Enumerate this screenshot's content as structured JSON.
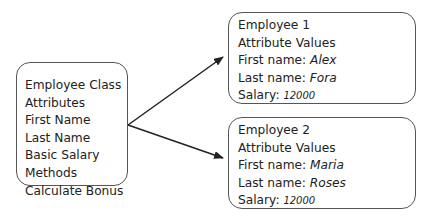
{
  "class_box": {
    "lines": [
      "Employee Class",
      "Attributes",
      "First Name",
      "Last Name",
      "Basic Salary",
      "Methods",
      "Calculate Bonus"
    ]
  },
  "employees": [
    {
      "title": "Employee 1",
      "subtitle": "Attribute Values",
      "first_name_label": "First name: ",
      "first_name": "Alex",
      "last_name_label": "Last name: ",
      "last_name": "Fora",
      "salary_label": "Salary: ",
      "salary": "12000"
    },
    {
      "title": "Employee 2",
      "subtitle": "Attribute Values",
      "first_name_label": "First name: ",
      "first_name": "Maria",
      "last_name_label": "Last name: ",
      "last_name": "Roses",
      "salary_label": "Salary: ",
      "salary": "12000"
    }
  ],
  "colors": {
    "border": "#555555",
    "text": "#222222",
    "arrow": "#222222"
  }
}
